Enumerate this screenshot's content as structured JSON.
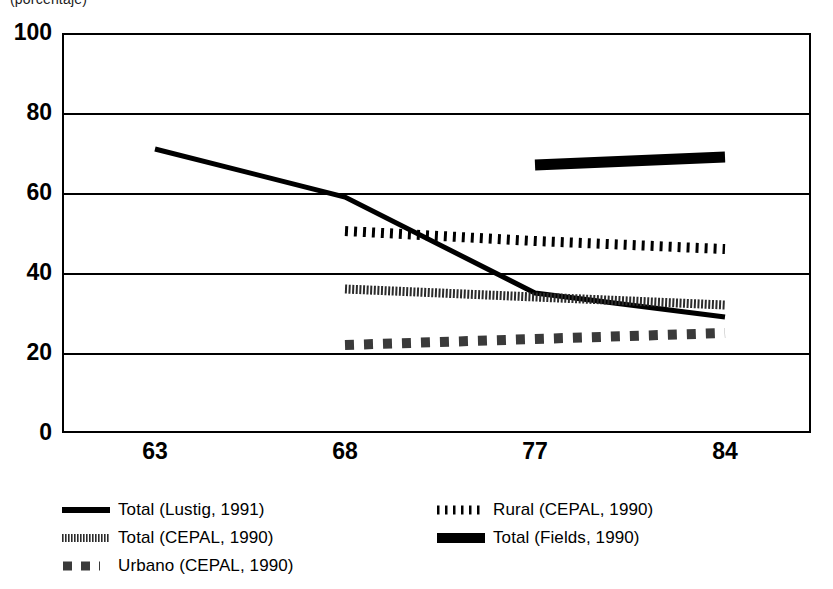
{
  "title_sliver": "(porcentaje)",
  "chart_data": {
    "type": "line",
    "title": "",
    "subtitle": "",
    "xlabel": "",
    "ylabel": "",
    "x": [
      "63",
      "68",
      "77",
      "84"
    ],
    "categories": [
      "63",
      "68",
      "77",
      "84"
    ],
    "ylim": [
      0,
      100
    ],
    "yticks": [
      0,
      20,
      40,
      60,
      80,
      100
    ],
    "ytick_labels": [
      "0",
      "20",
      "40",
      "60",
      "80",
      "100"
    ],
    "xtick_labels": [
      "63",
      "68",
      "77",
      "84"
    ],
    "grid": "horizontal",
    "legend_position": "bottom",
    "series": [
      {
        "name": "Total (Lustig, 1991)",
        "style": "solid-thick",
        "color": "#000000",
        "x": [
          "63",
          "68",
          "77",
          "84"
        ],
        "values": [
          71,
          59,
          35,
          29
        ]
      },
      {
        "name": "Total (CEPAL, 1990)",
        "style": "dense-dotted-thick",
        "color": "#2b2b2b",
        "x": [
          "68",
          "77",
          "84"
        ],
        "values": [
          36,
          34,
          32
        ]
      },
      {
        "name": "Urbano (CEPAL, 1990)",
        "style": "dashed-square",
        "color": "#3a3a3a",
        "x": [
          "68",
          "77",
          "84"
        ],
        "values": [
          22,
          23.5,
          25
        ]
      },
      {
        "name": "Rural (CEPAL, 1990)",
        "style": "dotted",
        "color": "#000000",
        "x": [
          "68",
          "77",
          "84"
        ],
        "values": [
          50.5,
          48,
          46
        ]
      },
      {
        "name": "Total (Fields, 1990)",
        "style": "solid-extra-thick",
        "color": "#000000",
        "x": [
          "77",
          "84"
        ],
        "values": [
          67,
          69
        ]
      }
    ]
  },
  "legend": {
    "left_column": [
      {
        "label": "Total (Lustig, 1991)",
        "swatch": "solid-thick-swatch"
      },
      {
        "label": "Total (CEPAL, 1990)",
        "swatch": "dense-dotted-swatch"
      },
      {
        "label": "Urbano (CEPAL, 1990)",
        "swatch": "dashed-square-swatch"
      }
    ],
    "right_column": [
      {
        "label": "Rural (CEPAL, 1990)",
        "swatch": "dotted-swatch"
      },
      {
        "label": "Total (Fields, 1990)",
        "swatch": "solid-extra-thick-swatch"
      }
    ]
  }
}
